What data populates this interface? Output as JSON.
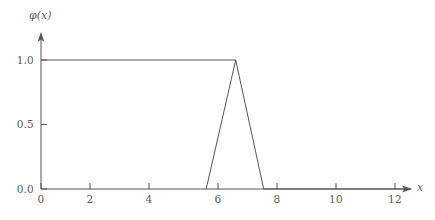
{
  "chart_data": {
    "type": "line",
    "title": "",
    "subtitle": "",
    "xlabel": "x",
    "ylabel": "φ(x)",
    "xlim": [
      0,
      12.6
    ],
    "ylim": [
      0,
      1.18
    ],
    "grid": false,
    "legend": null,
    "x_ticks": [
      {
        "value": 0,
        "label": "0"
      },
      {
        "value": 2,
        "label": "2"
      },
      {
        "value": 4,
        "label": "4"
      },
      {
        "value": 6,
        "label": "6"
      },
      {
        "value": 8,
        "label": "8"
      },
      {
        "value": 10,
        "label": "10"
      },
      {
        "value": 12,
        "label": "12"
      }
    ],
    "y_ticks": [
      {
        "value": 0.0,
        "label": "0.0"
      },
      {
        "value": 0.5,
        "label": "0.5"
      },
      {
        "value": 1.0,
        "label": "1.0"
      }
    ],
    "series": [
      {
        "name": "phi",
        "color": "#555555",
        "x": [
          0.0,
          5.6,
          6.6,
          7.55,
          12.55
        ],
        "values": [
          1.0,
          1.0,
          1.0,
          0.0,
          0.0
        ],
        "points": [
          {
            "x": 0.0,
            "y": 1.0
          },
          {
            "x": 5.6,
            "y": 1.0
          },
          {
            "x": 6.6,
            "y": 1.0
          },
          {
            "x": 7.55,
            "y": 0.0
          },
          {
            "x": 12.55,
            "y": 0.0
          }
        ]
      },
      {
        "name": "phi-rising-edge",
        "color": "#555555",
        "x": [
          5.6,
          6.6
        ],
        "values": [
          0.0,
          1.0
        ],
        "points": [
          {
            "x": 5.6,
            "y": 0.0
          },
          {
            "x": 6.6,
            "y": 1.0
          }
        ]
      }
    ],
    "annotations": [],
    "axis_style": {
      "x_axis_arrow": true,
      "y_axis_arrow": true,
      "axis_color": "#555555",
      "line_width": 1
    }
  },
  "labels": {
    "y_axis_title": "φ(x)",
    "x_axis_title": "x"
  }
}
